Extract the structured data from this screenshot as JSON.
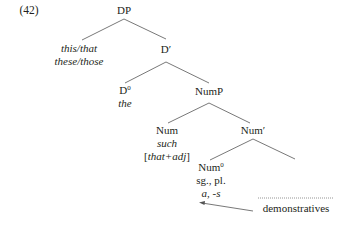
{
  "example_number": "(42)",
  "tree": {
    "DP": {
      "label": "DP"
    },
    "spec_DP": {
      "line1": "this/that",
      "line2": "these/those"
    },
    "D_bar": {
      "label": "D′"
    },
    "D0": {
      "label": "D",
      "sup": "0",
      "word": "the"
    },
    "NumP": {
      "label": "NumP"
    },
    "Num_spec": {
      "label": "Num",
      "word": "such",
      "bracket_open": "[",
      "bracket_content": "that+adj",
      "bracket_close": "]"
    },
    "Num_bar": {
      "label": "Num′"
    },
    "Num0": {
      "label": "Num",
      "sup": "0",
      "features": "sg., pl.",
      "forms": "a, -s"
    }
  },
  "annotation": {
    "label": "demonstratives"
  }
}
